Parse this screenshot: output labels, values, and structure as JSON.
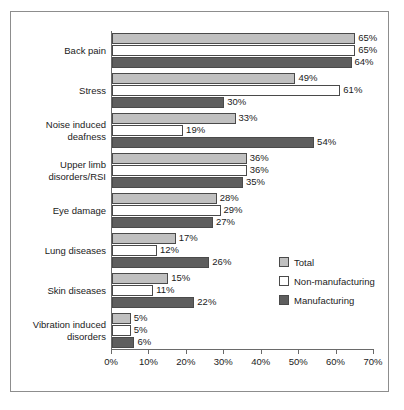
{
  "chart_data": {
    "type": "bar",
    "orientation": "horizontal",
    "title": "",
    "xlabel": "",
    "ylabel": "",
    "xlim": [
      0,
      70
    ],
    "xtick_labels": [
      "0%",
      "10%",
      "20%",
      "30%",
      "40%",
      "50%",
      "60%",
      "70%"
    ],
    "xtick_values": [
      0,
      10,
      20,
      30,
      40,
      50,
      60,
      70
    ],
    "grid": false,
    "legend_position": "middle-right",
    "categories": [
      "Back pain",
      "Stress",
      "Noise induced\ndeafness",
      "Upper limb\ndisorders/RSI",
      "Eye damage",
      "Lung diseases",
      "Skin diseases",
      "Vibration induced\ndisorders"
    ],
    "series": [
      {
        "name": "Total",
        "color": "#c0c0c0",
        "values": [
          65,
          49,
          33,
          36,
          28,
          17,
          15,
          5
        ],
        "labels": [
          "65%",
          "49%",
          "33%",
          "36%",
          "28%",
          "17%",
          "15%",
          "5%"
        ]
      },
      {
        "name": "Non-manufacturing",
        "color": "#ffffff",
        "values": [
          65,
          61,
          19,
          36,
          29,
          12,
          11,
          5
        ],
        "labels": [
          "65%",
          "61%",
          "19%",
          "36%",
          "29%",
          "12%",
          "11%",
          "5%"
        ]
      },
      {
        "name": "Manufacturing",
        "color": "#5e5e5e",
        "values": [
          64,
          30,
          54,
          35,
          27,
          26,
          22,
          6
        ],
        "labels": [
          "64%",
          "30%",
          "54%",
          "35%",
          "27%",
          "26%",
          "22%",
          "6%"
        ]
      }
    ]
  },
  "legend": {
    "items": [
      {
        "label": "Total",
        "swatch": "total"
      },
      {
        "label": "Non-manufacturing",
        "swatch": "nonmanu"
      },
      {
        "label": "Manufacturing",
        "swatch": "manu"
      }
    ]
  },
  "colors": {
    "total": "#c0c0c0",
    "non_manufacturing": "#ffffff",
    "manufacturing": "#5e5e5e",
    "axis": "#6a6a6a",
    "frame": "#8d8d8d",
    "text": "#1b1b1b"
  }
}
